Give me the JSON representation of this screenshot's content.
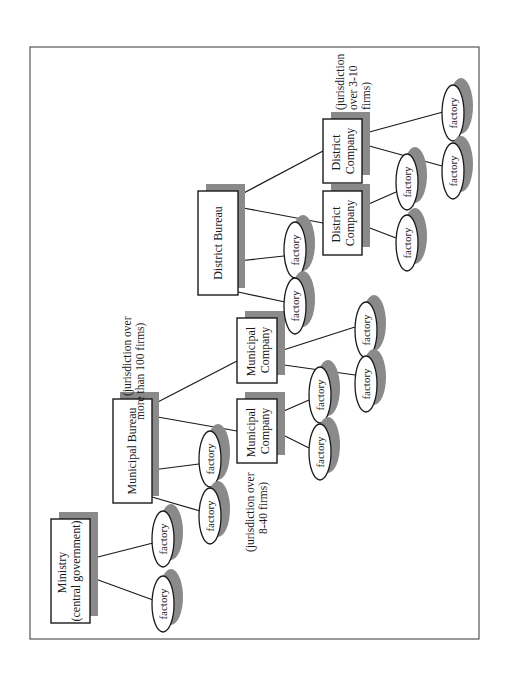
{
  "diagram": {
    "orientation": "rotated-90-ccw",
    "nodes": {
      "ministry": {
        "lines": [
          "Ministry",
          "(central government)"
        ]
      },
      "municipal_bureau": {
        "lines": [
          "Municipal Bureau"
        ]
      },
      "district_bureau": {
        "lines": [
          "District Bureau"
        ]
      },
      "municipal_company_1": {
        "lines": [
          "Municipal",
          "Company"
        ]
      },
      "municipal_company_2": {
        "lines": [
          "Municipal",
          "Company"
        ]
      },
      "district_company_1": {
        "lines": [
          "District",
          "Company"
        ]
      },
      "district_company_2": {
        "lines": [
          "District",
          "Company"
        ]
      }
    },
    "factory_label": "factory",
    "notes": {
      "municipal_bureau": [
        "(jurisdiction over",
        "more than 100 firms)"
      ],
      "municipal_company": [
        "(jurisdiction over",
        "8-40 firms)"
      ],
      "district_company": [
        "(jurisdiction",
        "over 3-10",
        "firms)"
      ]
    },
    "hierarchy": [
      {
        "parent": "Ministry (central government)",
        "children": [
          "factory",
          "factory"
        ]
      },
      {
        "parent": "Municipal Bureau",
        "children": [
          "factory",
          "factory",
          "Municipal Company",
          "Municipal Company"
        ]
      },
      {
        "parent": "Municipal Company",
        "children": [
          "factory",
          "factory"
        ]
      },
      {
        "parent": "Municipal Company",
        "children": [
          "factory",
          "factory"
        ]
      },
      {
        "parent": "District Bureau",
        "children": [
          "factory",
          "factory",
          "District Company",
          "District Company"
        ]
      },
      {
        "parent": "District Company",
        "children": [
          "factory",
          "factory"
        ]
      },
      {
        "parent": "District Company",
        "children": [
          "factory",
          "factory"
        ]
      }
    ],
    "colors": {
      "shadow": "#8a8a8a",
      "stroke": "#1a1a1a",
      "frame": "#555555"
    }
  }
}
